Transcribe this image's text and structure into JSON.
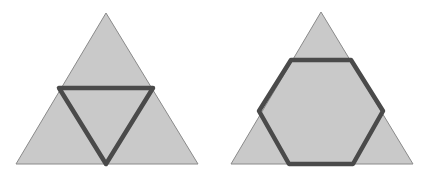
{
  "figure": {
    "colors": {
      "background": "#ffffff",
      "triangle_fill": "#c9c9c9",
      "triangle_edge": "#8a8a8a",
      "highlight_stroke": "#4a4a4a"
    },
    "panels": [
      {
        "id": "left",
        "outer_triangle": [
          [
            106,
            13
          ],
          [
            198,
            164
          ],
          [
            16,
            164
          ]
        ],
        "highlight_shape": "inverted-triangle",
        "highlight_points": [
          [
            59,
            88
          ],
          [
            153,
            88
          ],
          [
            106,
            164
          ]
        ]
      },
      {
        "id": "right",
        "outer_triangle": [
          [
            321,
            12
          ],
          [
            413,
            164
          ],
          [
            231,
            164
          ]
        ],
        "highlight_shape": "hexagon",
        "highlight_points": [
          [
            291,
            60
          ],
          [
            351,
            60
          ],
          [
            383,
            111
          ],
          [
            353,
            164
          ],
          [
            289,
            164
          ],
          [
            259,
            111
          ]
        ]
      }
    ]
  }
}
